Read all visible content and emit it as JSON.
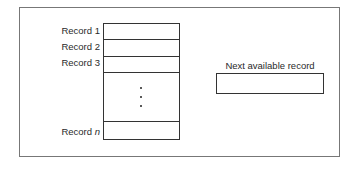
{
  "diagram": {
    "records": [
      {
        "label": "Record 1"
      },
      {
        "label": "Record 2"
      },
      {
        "label": "Record 3"
      }
    ],
    "ellipsis": "⋮",
    "last_record": {
      "prefix": "Record ",
      "var": "n"
    },
    "next_available": {
      "label": "Next available record"
    }
  }
}
